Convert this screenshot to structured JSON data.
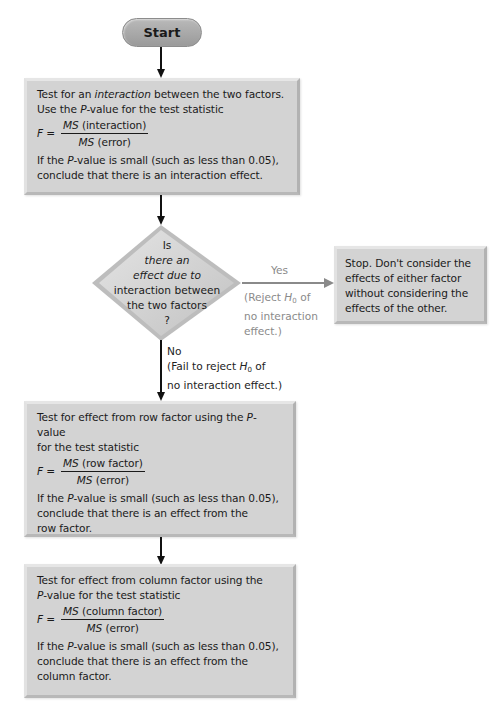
{
  "start": {
    "label": "Start"
  },
  "box1": {
    "line1_pre": "Test for an ",
    "line1_italic": "interaction",
    "line1_post": " between the two factors.",
    "line2_pre": "Use the ",
    "line2_italic": "P",
    "line2_post": "-value for the test statistic",
    "formula_lhs": "F =",
    "num_ms": "MS",
    "num_text": " (interaction)",
    "den_ms": "MS",
    "den_text": " (error)",
    "concl1_pre": "If the ",
    "concl1_italic": "P",
    "concl1_post": "-value is small (such as less than 0.05),",
    "concl2": "conclude that there is an interaction effect."
  },
  "decision": {
    "lines": [
      "Is",
      "there an",
      "effect due to",
      "interaction between",
      "the two factors",
      "?"
    ]
  },
  "yes_branch": {
    "label": "Yes",
    "note_line1_pre": "(Reject ",
    "note_h": "H",
    "note_sub": "0",
    "note_line1_post": " of",
    "note_line2": "no interaction",
    "note_line3": "effect.)"
  },
  "stop_box": {
    "lines": [
      "Stop. Don't consider the",
      "effects of either factor",
      "without considering the",
      "effects of the other."
    ]
  },
  "no_branch": {
    "label": "No",
    "note_line1_pre": "(Fail to reject ",
    "note_h": "H",
    "note_sub": "0",
    "note_line1_post": " of",
    "note_line2": "no interaction effect.)"
  },
  "box3": {
    "line1_pre": "Test for effect from row factor using the ",
    "line1_italic": "P",
    "line1_post": "-value",
    "line2": "for the test statistic",
    "formula_lhs": "F =",
    "num_ms": "MS",
    "num_text": " (row factor)",
    "den_ms": "MS",
    "den_text": " (error)",
    "concl1_pre": "If the ",
    "concl1_italic": "P",
    "concl1_post": "-value is small (such as less than 0.05),",
    "concl2": "conclude that there is an effect from the",
    "concl3": "row factor."
  },
  "box4": {
    "line1": "Test for effect from column factor using the",
    "line2_italic": "P",
    "line2_post": "-value for the test statistic",
    "formula_lhs": "F =",
    "num_ms": "MS",
    "num_text": " (column factor)",
    "den_ms": "MS",
    "den_text": " (error)",
    "concl1_pre": "If the ",
    "concl1_italic": "P",
    "concl1_post": "-value is small (such as less than 0.05),",
    "concl2": "conclude that there is an effect from the",
    "concl3": "column factor."
  },
  "colors": {
    "box_fill": "#d3d3d3",
    "pill_fill": "#a8a8a8",
    "arrow_dark": "#111111",
    "arrow_gray": "#8a8a8a",
    "gray_text": "#8a8a8a"
  }
}
